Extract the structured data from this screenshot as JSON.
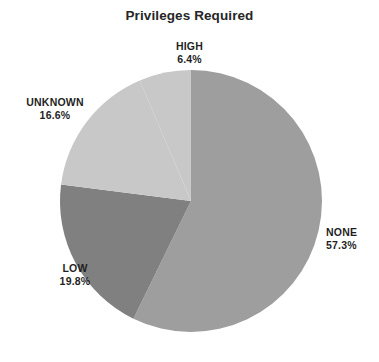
{
  "chart_data": {
    "type": "pie",
    "title": "Privileges Required",
    "xlabel": "",
    "ylabel": "",
    "legend_position": "none",
    "grid": false,
    "labels_outside": true,
    "start_angle_deg": 90,
    "direction": "clockwise",
    "categories": [
      "NONE",
      "LOW",
      "UNKNOWN",
      "HIGH"
    ],
    "values": [
      57.3,
      19.8,
      16.6,
      6.4
    ],
    "value_unit": "percent",
    "slices": [
      {
        "label": "NONE",
        "percent_text": "57.3%",
        "value": 57.3,
        "color": "#9e9e9e"
      },
      {
        "label": "LOW",
        "percent_text": "19.8%",
        "value": 19.8,
        "color": "#808080"
      },
      {
        "label": "UNKNOWN",
        "percent_text": "16.6%",
        "value": 16.6,
        "color": "#c8c8c8"
      },
      {
        "label": "HIGH",
        "percent_text": "6.4%",
        "value": 6.4,
        "color": "#c8c8c8"
      }
    ]
  },
  "chart": {
    "title": "Privileges Required",
    "background_color": "#ffffff",
    "label_color": "#1f1f1f",
    "center_x": 191,
    "center_y": 201,
    "radius": 131
  },
  "labels": {
    "high": {
      "name": "HIGH",
      "pct": "6.4%"
    },
    "unknown": {
      "name": "UNKNOWN",
      "pct": "16.6%"
    },
    "low": {
      "name": "LOW",
      "pct": "19.8%"
    },
    "none": {
      "name": "NONE",
      "pct": "57.3%"
    }
  }
}
